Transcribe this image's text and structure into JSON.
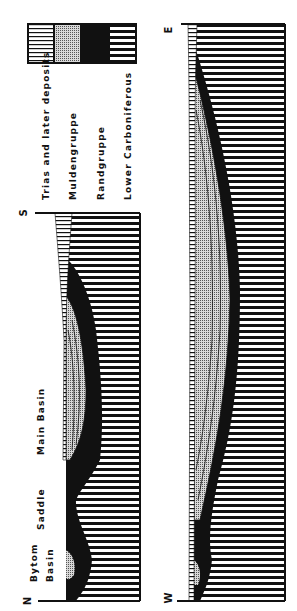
{
  "figure": {
    "orientation": "rotated-90-ccw",
    "legend": {
      "items": [
        {
          "key": "trias",
          "label": "Trias and later deposits",
          "pattern": "fine-lines"
        },
        {
          "key": "mulden",
          "label": "Muldengruppe",
          "pattern": "stipple-grid"
        },
        {
          "key": "rand",
          "label": "Randgruppe",
          "pattern": "solid-black"
        },
        {
          "key": "lower",
          "label": "Lower Carboniferous",
          "pattern": "coarse-lines"
        }
      ]
    },
    "section_ns": {
      "start_label": "N",
      "end_label": "S",
      "features": [
        {
          "label": "Bytom",
          "id": "bytom"
        },
        {
          "label": "Basin",
          "id": "bytom-basin"
        },
        {
          "label": "Saddle",
          "id": "saddle"
        },
        {
          "label": "Main   Basin",
          "id": "main-basin"
        }
      ]
    },
    "section_we": {
      "start_label": "W",
      "end_label": "E"
    }
  }
}
